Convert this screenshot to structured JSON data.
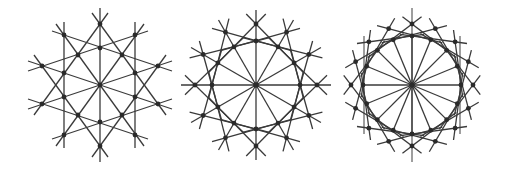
{
  "colors": {
    "background": "#ffffff",
    "line": "#3a3a3a",
    "dot": "#2a2a2a"
  },
  "figures": [
    {
      "name": "figure-hexagonal-arrangement",
      "center": [
        100,
        85
      ],
      "dots": [
        [
          100,
          24
        ],
        [
          64,
          35
        ],
        [
          135,
          35
        ],
        [
          78,
          55
        ],
        [
          100,
          48
        ],
        [
          122,
          55
        ],
        [
          42,
          66
        ],
        [
          64,
          73
        ],
        [
          135,
          73
        ],
        [
          158,
          66
        ],
        [
          100,
          85
        ],
        [
          64,
          97
        ],
        [
          135,
          97
        ],
        [
          42,
          104
        ],
        [
          158,
          104
        ],
        [
          78,
          115
        ],
        [
          122,
          115
        ],
        [
          100,
          122
        ],
        [
          64,
          135
        ],
        [
          135,
          135
        ],
        [
          100,
          146
        ]
      ],
      "lines": [
        [
          100,
          8,
          100,
          162
        ],
        [
          64,
          22,
          64,
          148
        ],
        [
          135,
          22,
          135,
          148
        ],
        [
          108,
          13,
          34,
          115
        ],
        [
          92,
          13,
          166,
          115
        ],
        [
          108,
          157,
          34,
          55
        ],
        [
          92,
          157,
          166,
          55
        ],
        [
          56,
          24,
          144,
          146
        ],
        [
          144,
          24,
          56,
          146
        ],
        [
          28,
          61,
          172,
          109
        ],
        [
          28,
          109,
          172,
          61
        ],
        [
          28,
          71,
          148,
          31
        ],
        [
          172,
          71,
          52,
          31
        ],
        [
          28,
          99,
          148,
          139
        ],
        [
          172,
          99,
          52,
          139
        ]
      ]
    },
    {
      "name": "figure-12-fold-arrangement",
      "center": [
        256,
        85
      ],
      "n": 12,
      "r_out": 61,
      "r_in": 44,
      "ext": 14,
      "spokes": "full",
      "verticals": []
    },
    {
      "name": "figure-16-fold-arrangement",
      "center": [
        412,
        85
      ],
      "n": 16,
      "r_out": 61,
      "r_in": 49,
      "ext": 12,
      "spokes": "inner",
      "verticals": [
        [
          364,
          36,
          134
        ],
        [
          460,
          36,
          134
        ],
        [
          412,
          8,
          162
        ]
      ]
    }
  ]
}
